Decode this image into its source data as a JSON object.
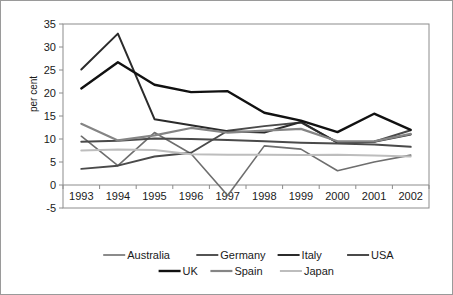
{
  "chart_data": {
    "type": "line",
    "title": "",
    "xlabel": "",
    "ylabel": "per cent",
    "categories": [
      "1993",
      "1994",
      "1995",
      "1996",
      "1997",
      "1998",
      "1999",
      "2000",
      "2001",
      "2002"
    ],
    "x": [
      1993,
      1994,
      1995,
      1996,
      1997,
      1998,
      1999,
      2000,
      2001,
      2002
    ],
    "ylim": [
      -5,
      35
    ],
    "yticks": [
      -5,
      0,
      5,
      10,
      15,
      20,
      25,
      30,
      35
    ],
    "ytick_labels": [
      "-5",
      "0",
      "5",
      "10",
      "15",
      "20",
      "25",
      "30",
      "35"
    ],
    "grid": false,
    "legend_position": "bottom",
    "legend_rows": [
      [
        "Australia",
        "Germany",
        "Italy",
        "USA"
      ],
      [
        "UK",
        "Spain",
        "Japan"
      ]
    ],
    "series": [
      {
        "name": "Australia",
        "color": "#6e6e6e",
        "width": 1.6,
        "values": [
          10.6,
          4.2,
          11.4,
          6.8,
          -2.3,
          8.5,
          7.8,
          3.1,
          5.0,
          6.5
        ]
      },
      {
        "name": "Germany",
        "color": "#4a4a4a",
        "width": 1.9,
        "values": [
          3.5,
          4.2,
          6.2,
          7.0,
          11.8,
          12.8,
          13.6,
          9.2,
          9.4,
          11.9
        ]
      },
      {
        "name": "Italy",
        "color": "#2b2b2b",
        "width": 2.0,
        "values": [
          25.1,
          32.9,
          14.3,
          13.0,
          11.7,
          11.4,
          13.7,
          9.2,
          9.4,
          11.0
        ]
      },
      {
        "name": "USA",
        "color": "#4a4a4a",
        "width": 2.0,
        "values": [
          9.4,
          9.6,
          10.1,
          10.0,
          9.8,
          9.5,
          9.2,
          9.0,
          8.8,
          8.3
        ]
      },
      {
        "name": "UK",
        "color": "#111111",
        "width": 2.4,
        "values": [
          21.0,
          26.7,
          21.8,
          20.2,
          20.4,
          15.7,
          14.0,
          11.5,
          15.5,
          12.0
        ]
      },
      {
        "name": "Spain",
        "color": "#858585",
        "width": 2.2,
        "values": [
          13.3,
          9.7,
          10.8,
          12.4,
          11.4,
          11.8,
          12.2,
          9.5,
          9.5,
          11.1
        ]
      },
      {
        "name": "Japan",
        "color": "#bdbdbd",
        "width": 2.0,
        "values": [
          7.5,
          7.7,
          7.6,
          6.7,
          6.6,
          6.6,
          6.5,
          6.6,
          6.4,
          6.2
        ]
      }
    ]
  },
  "colors": {
    "frame": "#9a9a9a",
    "axis": "#8c8c8c",
    "text": "#1a1a1a",
    "background": "#ffffff"
  }
}
